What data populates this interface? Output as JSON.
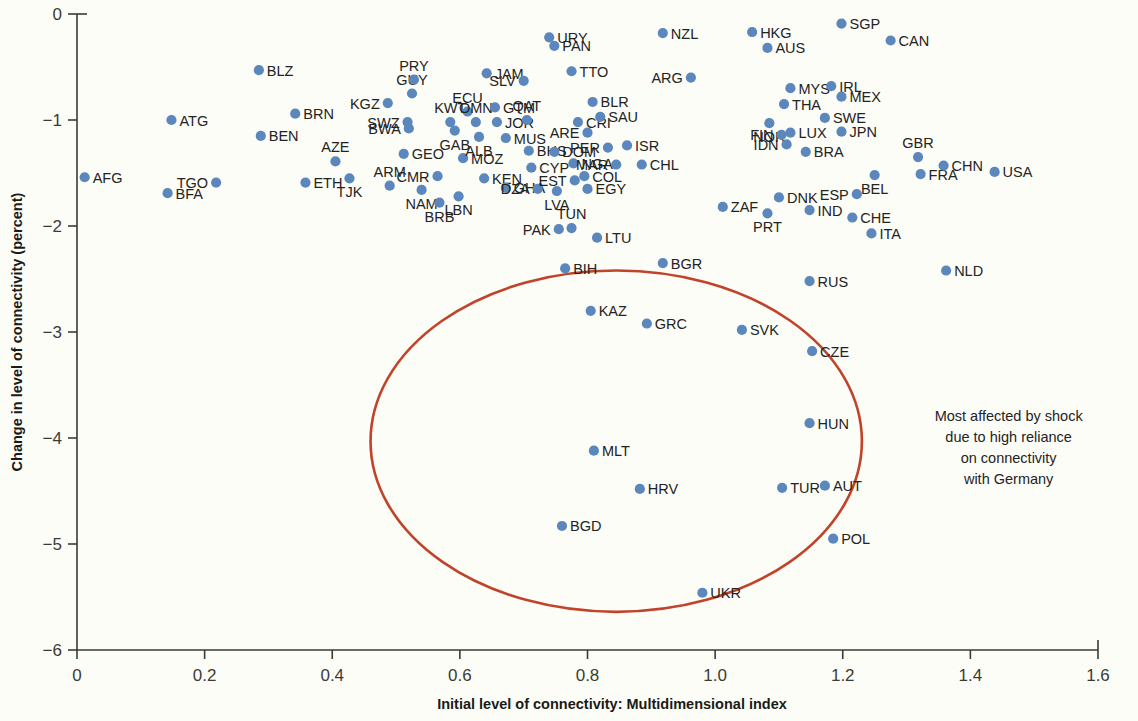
{
  "chart_data": {
    "type": "scatter",
    "title": "",
    "xlabel": "Initial level of connectivity: Multidimensional index",
    "ylabel": "Change in level of connectivity (percent)",
    "xlim": [
      0,
      1.6
    ],
    "ylim": [
      -6,
      0
    ],
    "xticks": [
      "0",
      "0.2",
      "0.4",
      "0.6",
      "0.8",
      "1.0",
      "1.2",
      "1.4",
      "1.6"
    ],
    "xtick_values": [
      0,
      0.2,
      0.4,
      0.6,
      0.8,
      1.0,
      1.2,
      1.4,
      1.6
    ],
    "yticks": [
      "0",
      "−1",
      "−2",
      "−3",
      "−4",
      "−5",
      "−6"
    ],
    "ytick_values": [
      0,
      -1,
      -2,
      -3,
      -4,
      -5,
      -6
    ],
    "grid": false,
    "legend": false,
    "marker_color": "#5b87bd",
    "highlight_color": "#c0432a",
    "annotation": {
      "lines": [
        "Most affected by shock",
        "due to high reliance",
        "on connectivity",
        "with Germany"
      ],
      "x": 1.46,
      "y": -4.05
    },
    "highlight_region": {
      "shape": "ellipse",
      "center_x": 0.845,
      "center_y": -4.03,
      "radius_x": 0.385,
      "radius_y": 1.61
    },
    "points": [
      {
        "code": "AFG",
        "x": 0.012,
        "y": -1.54,
        "side": "r"
      },
      {
        "code": "BFA",
        "x": 0.142,
        "y": -1.69,
        "side": "r"
      },
      {
        "code": "ATG",
        "x": 0.148,
        "y": -1.0,
        "side": "r"
      },
      {
        "code": "TGO",
        "x": 0.218,
        "y": -1.59,
        "side": "l"
      },
      {
        "code": "BLZ",
        "x": 0.285,
        "y": -0.53,
        "side": "r"
      },
      {
        "code": "BEN",
        "x": 0.288,
        "y": -1.15,
        "side": "r"
      },
      {
        "code": "BRN",
        "x": 0.342,
        "y": -0.94,
        "side": "r"
      },
      {
        "code": "ETH",
        "x": 0.358,
        "y": -1.59,
        "side": "r"
      },
      {
        "code": "AZE",
        "x": 0.405,
        "y": -1.39,
        "side": "a"
      },
      {
        "code": "TJK",
        "x": 0.427,
        "y": -1.55,
        "side": "b"
      },
      {
        "code": "KGZ",
        "x": 0.487,
        "y": -0.84,
        "side": "l"
      },
      {
        "code": "ARM",
        "x": 0.49,
        "y": -1.62,
        "side": "a"
      },
      {
        "code": "GEO",
        "x": 0.512,
        "y": -1.32,
        "side": "r"
      },
      {
        "code": "SWZ",
        "x": 0.518,
        "y": -1.02,
        "side": "l"
      },
      {
        "code": "GUY",
        "x": 0.525,
        "y": -0.75,
        "side": "a"
      },
      {
        "code": "PRY",
        "x": 0.528,
        "y": -0.62,
        "side": "a"
      },
      {
        "code": "BWA",
        "x": 0.52,
        "y": -1.08,
        "side": "l"
      },
      {
        "code": "NAM",
        "x": 0.54,
        "y": -1.66,
        "side": "b"
      },
      {
        "code": "CMR",
        "x": 0.565,
        "y": -1.53,
        "side": "l"
      },
      {
        "code": "BRB",
        "x": 0.568,
        "y": -1.78,
        "side": "b"
      },
      {
        "code": "LBN",
        "x": 0.598,
        "y": -1.72,
        "side": "b"
      },
      {
        "code": "KWT",
        "x": 0.585,
        "y": -1.02,
        "side": "a"
      },
      {
        "code": "GAB",
        "x": 0.592,
        "y": -1.1,
        "side": "b"
      },
      {
        "code": "MOZ",
        "x": 0.605,
        "y": -1.36,
        "side": "r"
      },
      {
        "code": "ECU",
        "x": 0.612,
        "y": -0.92,
        "side": "a"
      },
      {
        "code": "OMN",
        "x": 0.625,
        "y": -1.02,
        "side": "a"
      },
      {
        "code": "ALB",
        "x": 0.63,
        "y": -1.16,
        "side": "b"
      },
      {
        "code": "KEN",
        "x": 0.638,
        "y": -1.55,
        "side": "r"
      },
      {
        "code": "JAM",
        "x": 0.642,
        "y": -0.56,
        "side": "r"
      },
      {
        "code": "GTM",
        "x": 0.655,
        "y": -0.88,
        "side": "r"
      },
      {
        "code": "JOR",
        "x": 0.658,
        "y": -1.02,
        "side": "r"
      },
      {
        "code": "MUS",
        "x": 0.672,
        "y": -1.17,
        "side": "r"
      },
      {
        "code": "GHA",
        "x": 0.672,
        "y": -1.64,
        "side": "r"
      },
      {
        "code": "SLV",
        "x": 0.7,
        "y": -0.63,
        "side": "l"
      },
      {
        "code": "QAT",
        "x": 0.705,
        "y": -1.0,
        "side": "a"
      },
      {
        "code": "BHS",
        "x": 0.708,
        "y": -1.29,
        "side": "r"
      },
      {
        "code": "CYP",
        "x": 0.712,
        "y": -1.45,
        "side": "r"
      },
      {
        "code": "DZA",
        "x": 0.722,
        "y": -1.65,
        "side": "l"
      },
      {
        "code": "URY",
        "x": 0.74,
        "y": -0.22,
        "side": "r"
      },
      {
        "code": "PAN",
        "x": 0.748,
        "y": -0.3,
        "side": "r"
      },
      {
        "code": "DOM",
        "x": 0.748,
        "y": -1.3,
        "side": "r"
      },
      {
        "code": "LVA",
        "x": 0.752,
        "y": -1.67,
        "side": "b"
      },
      {
        "code": "PAK",
        "x": 0.755,
        "y": -2.03,
        "side": "l"
      },
      {
        "code": "TUN",
        "x": 0.775,
        "y": -2.02,
        "side": "a"
      },
      {
        "code": "NGA",
        "x": 0.778,
        "y": -1.41,
        "side": "r"
      },
      {
        "code": "EST",
        "x": 0.78,
        "y": -1.57,
        "side": "l"
      },
      {
        "code": "BIH",
        "x": 0.765,
        "y": -2.4,
        "side": "r"
      },
      {
        "code": "TTO",
        "x": 0.775,
        "y": -0.54,
        "side": "r"
      },
      {
        "code": "CRI",
        "x": 0.785,
        "y": -1.02,
        "side": "r"
      },
      {
        "code": "ARE",
        "x": 0.8,
        "y": -1.12,
        "side": "l"
      },
      {
        "code": "COL",
        "x": 0.795,
        "y": -1.53,
        "side": "r"
      },
      {
        "code": "EGY",
        "x": 0.8,
        "y": -1.65,
        "side": "r"
      },
      {
        "code": "BLR",
        "x": 0.808,
        "y": -0.83,
        "side": "r"
      },
      {
        "code": "SAU",
        "x": 0.82,
        "y": -0.97,
        "side": "r"
      },
      {
        "code": "KAZ",
        "x": 0.805,
        "y": -2.8,
        "side": "r"
      },
      {
        "code": "PER",
        "x": 0.832,
        "y": -1.26,
        "side": "l"
      },
      {
        "code": "MAR",
        "x": 0.845,
        "y": -1.42,
        "side": "l"
      },
      {
        "code": "LTU",
        "x": 0.815,
        "y": -2.11,
        "side": "r"
      },
      {
        "code": "MLT",
        "x": 0.81,
        "y": -4.12,
        "side": "r"
      },
      {
        "code": "BGD",
        "x": 0.76,
        "y": -4.83,
        "side": "r"
      },
      {
        "code": "HRV",
        "x": 0.882,
        "y": -4.48,
        "side": "r"
      },
      {
        "code": "BGR",
        "x": 0.918,
        "y": -2.35,
        "side": "r"
      },
      {
        "code": "ISR",
        "x": 0.862,
        "y": -1.24,
        "side": "r"
      },
      {
        "code": "CHL",
        "x": 0.885,
        "y": -1.42,
        "side": "r"
      },
      {
        "code": "GRC",
        "x": 0.893,
        "y": -2.92,
        "side": "r"
      },
      {
        "code": "NZL",
        "x": 0.918,
        "y": -0.18,
        "side": "r"
      },
      {
        "code": "ARG",
        "x": 0.962,
        "y": -0.6,
        "side": "l"
      },
      {
        "code": "UKR",
        "x": 0.98,
        "y": -5.46,
        "side": "r"
      },
      {
        "code": "SVK",
        "x": 1.042,
        "y": -2.98,
        "side": "r"
      },
      {
        "code": "ZAF",
        "x": 1.012,
        "y": -1.82,
        "side": "r"
      },
      {
        "code": "HKG",
        "x": 1.058,
        "y": -0.17,
        "side": "r"
      },
      {
        "code": "AUS",
        "x": 1.082,
        "y": -0.32,
        "side": "r"
      },
      {
        "code": "NOR",
        "x": 1.085,
        "y": -1.03,
        "side": "b"
      },
      {
        "code": "THA",
        "x": 1.108,
        "y": -0.85,
        "side": "r"
      },
      {
        "code": "PRT",
        "x": 1.082,
        "y": -1.88,
        "side": "b"
      },
      {
        "code": "DNK",
        "x": 1.1,
        "y": -1.73,
        "side": "r"
      },
      {
        "code": "FIN",
        "x": 1.104,
        "y": -1.14,
        "side": "l"
      },
      {
        "code": "LUX",
        "x": 1.118,
        "y": -1.12,
        "side": "r"
      },
      {
        "code": "IDN",
        "x": 1.112,
        "y": -1.23,
        "side": "l"
      },
      {
        "code": "MYS",
        "x": 1.118,
        "y": -0.7,
        "side": "r"
      },
      {
        "code": "TUR",
        "x": 1.105,
        "y": -4.47,
        "side": "r"
      },
      {
        "code": "AUT",
        "x": 1.172,
        "y": -4.45,
        "side": "r"
      },
      {
        "code": "HUN",
        "x": 1.148,
        "y": -3.86,
        "side": "r"
      },
      {
        "code": "CZE",
        "x": 1.152,
        "y": -3.18,
        "side": "r"
      },
      {
        "code": "RUS",
        "x": 1.148,
        "y": -2.52,
        "side": "r"
      },
      {
        "code": "IND",
        "x": 1.148,
        "y": -1.85,
        "side": "r"
      },
      {
        "code": "BRA",
        "x": 1.142,
        "y": -1.3,
        "side": "r"
      },
      {
        "code": "IRL",
        "x": 1.182,
        "y": -0.68,
        "side": "r"
      },
      {
        "code": "MEX",
        "x": 1.198,
        "y": -0.78,
        "side": "r"
      },
      {
        "code": "SWE",
        "x": 1.172,
        "y": -0.98,
        "side": "r"
      },
      {
        "code": "JPN",
        "x": 1.198,
        "y": -1.11,
        "side": "r"
      },
      {
        "code": "POL",
        "x": 1.185,
        "y": -4.95,
        "side": "r"
      },
      {
        "code": "SGP",
        "x": 1.198,
        "y": -0.09,
        "side": "r"
      },
      {
        "code": "CHE",
        "x": 1.215,
        "y": -1.92,
        "side": "r"
      },
      {
        "code": "ESP",
        "x": 1.222,
        "y": -1.7,
        "side": "l"
      },
      {
        "code": "ITA",
        "x": 1.245,
        "y": -2.07,
        "side": "r"
      },
      {
        "code": "BEL",
        "x": 1.25,
        "y": -1.52,
        "side": "b"
      },
      {
        "code": "CAN",
        "x": 1.275,
        "y": -0.25,
        "side": "r"
      },
      {
        "code": "GBR",
        "x": 1.318,
        "y": -1.35,
        "side": "a"
      },
      {
        "code": "FRA",
        "x": 1.322,
        "y": -1.51,
        "side": "r"
      },
      {
        "code": "NLD",
        "x": 1.362,
        "y": -2.42,
        "side": "r"
      },
      {
        "code": "CHN",
        "x": 1.358,
        "y": -1.43,
        "side": "r"
      },
      {
        "code": "USA",
        "x": 1.438,
        "y": -1.49,
        "side": "r"
      }
    ]
  }
}
